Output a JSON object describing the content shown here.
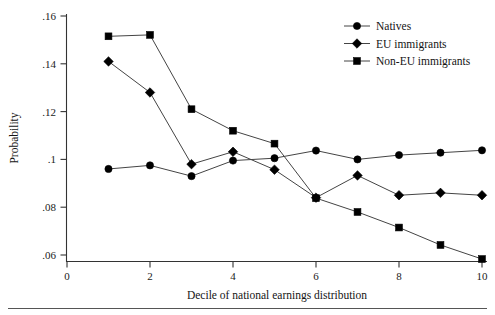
{
  "chart_data": {
    "type": "line",
    "title": "",
    "subtitle": "",
    "xlabel": "Decile of national earnings distribution",
    "ylabel": "Probability",
    "x": [
      1,
      2,
      3,
      4,
      5,
      6,
      7,
      8,
      9,
      10
    ],
    "categories": [
      "1",
      "2",
      "3",
      "4",
      "5",
      "6",
      "7",
      "8",
      "9",
      "10"
    ],
    "xlim": [
      0,
      10
    ],
    "ylim": [
      0.052,
      0.162
    ],
    "xticks": [
      0,
      2,
      4,
      6,
      8,
      10
    ],
    "xtick_labels": [
      "0",
      "2",
      "4",
      "6",
      "8",
      "10"
    ],
    "yticks": [
      0.06,
      0.08,
      0.1,
      0.12,
      0.14,
      0.16
    ],
    "ytick_labels": [
      ".06",
      ".08",
      ".1",
      ".12",
      ".14",
      ".16"
    ],
    "grid": false,
    "legend_position": "top-right",
    "series": [
      {
        "name": "Natives",
        "marker": "circle",
        "color": "#000000",
        "values": [
          0.096,
          0.0975,
          0.093,
          0.0995,
          0.1005,
          0.1037,
          0.1,
          0.1018,
          0.1028,
          0.1038
        ]
      },
      {
        "name": "EU immigrants",
        "marker": "diamond",
        "color": "#000000",
        "values": [
          0.141,
          0.128,
          0.098,
          0.1032,
          0.0957,
          0.084,
          0.0933,
          0.085,
          0.086,
          0.085
        ]
      },
      {
        "name": "Non-EU immigrants",
        "marker": "square",
        "color": "#000000",
        "values": [
          0.1515,
          0.1521,
          0.121,
          0.112,
          0.1066,
          0.0838,
          0.078,
          0.0715,
          0.0642,
          0.0583
        ]
      }
    ]
  },
  "axes": {
    "y_title": "Probability",
    "x_title": "Decile of national earnings distribution"
  },
  "legend": {
    "items": [
      {
        "label": "Natives",
        "marker": "circle-marker-icon"
      },
      {
        "label": "EU immigrants",
        "marker": "diamond-marker-icon"
      },
      {
        "label": "Non-EU immigrants",
        "marker": "square-marker-icon"
      }
    ]
  },
  "ticks": {
    "y": [
      ".16",
      ".14",
      ".12",
      ".1",
      ".08",
      ".06"
    ],
    "x": [
      "0",
      "2",
      "4",
      "6",
      "8",
      "10"
    ]
  }
}
